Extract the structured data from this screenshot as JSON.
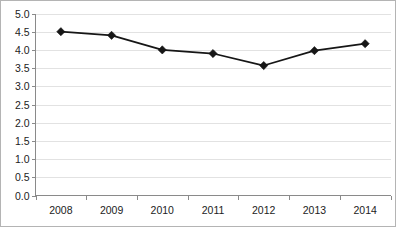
{
  "chart_data": {
    "type": "line",
    "title": "",
    "subtitle": "",
    "xlabel": "",
    "ylabel": "",
    "categories": [
      "2008",
      "2009",
      "2010",
      "2011",
      "2012",
      "2013",
      "2014"
    ],
    "values": [
      4.5,
      4.4,
      4.0,
      3.9,
      3.57,
      3.98,
      4.17
    ],
    "series": [
      {
        "name": "",
        "values": [
          4.5,
          4.4,
          4.0,
          3.9,
          3.57,
          3.98,
          4.17
        ]
      }
    ],
    "ylim": [
      0.0,
      5.0
    ],
    "ytick_labels": [
      "0.0",
      "0.5",
      "1.0",
      "1.5",
      "2.0",
      "2.5",
      "3.0",
      "3.5",
      "4.0",
      "4.5",
      "5.0"
    ],
    "ytick_values": [
      0.0,
      0.5,
      1.0,
      1.5,
      2.0,
      2.5,
      3.0,
      3.5,
      4.0,
      4.5,
      5.0
    ],
    "grid": true,
    "grid_axis": "y",
    "legend": false,
    "legend_position": "none",
    "marker": "diamond",
    "line_color": "#161616",
    "marker_color": "#161616",
    "grid_color": "#e2e2e2",
    "axis_color": "#8a8a8a",
    "background_color": "#ffffff",
    "border_color": "#b4b4b4"
  }
}
